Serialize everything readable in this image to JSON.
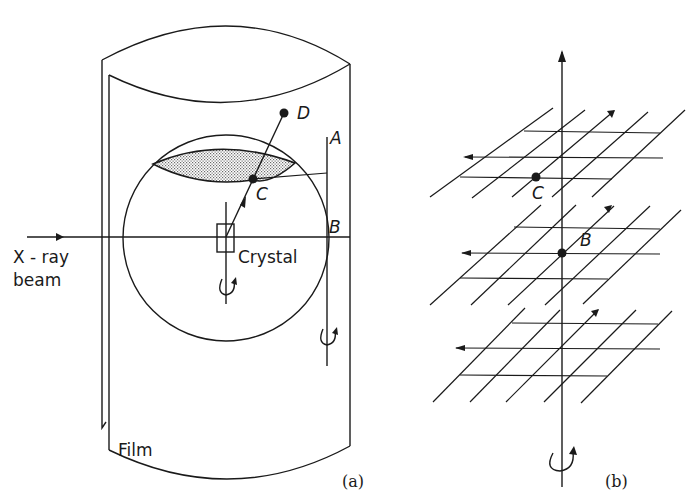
{
  "panel_a": {
    "caption": "(a)",
    "labels": {
      "xray_line1": "X - ray",
      "xray_line2": "beam",
      "crystal": "Crystal",
      "film": "Film",
      "point_a": "A",
      "point_b": "B",
      "point_c": "C",
      "point_d": "D"
    }
  },
  "panel_b": {
    "caption": "(b)",
    "labels": {
      "point_b": "B",
      "point_c": "C"
    }
  },
  "colors": {
    "ink": "#1a1a1a",
    "background": "#ffffff",
    "stipple": "#8a8a8a"
  }
}
